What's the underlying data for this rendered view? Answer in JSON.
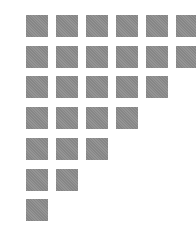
{
  "grid": {
    "square_color": "#8e8e8e",
    "background": "#ffffff",
    "square_size": 22,
    "pitch_x": 30,
    "pitch_y": 30.7,
    "origin_x": 26,
    "origin_y": 15,
    "row_counts": [
      6,
      6,
      5,
      4,
      3,
      2,
      1
    ]
  }
}
